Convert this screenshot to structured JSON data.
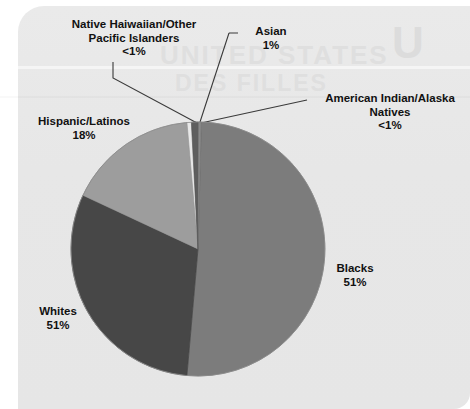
{
  "chart_data": {
    "type": "pie",
    "title": "",
    "subtitle": "",
    "xlabel": "",
    "ylabel": "",
    "legend_position": "callout-labels",
    "grid": false,
    "note": "Percentages as printed on the figure; labels point to slices with leader lines.",
    "slices": [
      {
        "name": "blacks",
        "label": "Blacks",
        "value_label": "51%",
        "value": 51,
        "color": "#7c7c7c",
        "start_angle_deg": 1.5,
        "end_angle_deg": 185.0
      },
      {
        "name": "whites",
        "label": "Whites",
        "value_label": "51%",
        "value": 31,
        "color": "#474747",
        "start_angle_deg": 185.0,
        "end_angle_deg": 295.0
      },
      {
        "name": "hispanic-latinos",
        "label": "Hispanic/Latinos",
        "value_label": "18%",
        "value": 18,
        "color": "#9d9d9d",
        "start_angle_deg": 295.0,
        "end_angle_deg": 355.0
      },
      {
        "name": "native-hawaiian-other-pacific-islanders",
        "label": "Native Haiwaiian/Other Pacific Islanders",
        "value_label": "<1%",
        "value": 0.4,
        "color": "#8a8a8a",
        "start_angle_deg": 355.0,
        "end_angle_deg": 357.0
      },
      {
        "name": "asian",
        "label": "Asian",
        "value_label": "1%",
        "value": 1,
        "color": "#5e5e5e",
        "start_angle_deg": 357.0,
        "end_angle_deg": 360.2
      },
      {
        "name": "american-indian-alaska-natives",
        "label": "American Indian/Alaska Natives",
        "value_label": "<1%",
        "value": 0.4,
        "color": "#8a8a8a",
        "start_angle_deg": 360.2,
        "end_angle_deg": 361.5
      }
    ],
    "categories": [
      "Blacks",
      "Whites",
      "Hispanic/Latinos",
      "Native Haiwaiian/Other Pacific Islanders",
      "Asian",
      "American Indian/Alaska Natives"
    ],
    "values": [
      51,
      51,
      18,
      0.4,
      1,
      0.4
    ],
    "value_labels": [
      "51%",
      "51%",
      "18%",
      "<1%",
      "1%",
      "<1%"
    ]
  },
  "labels": {
    "nhpi": {
      "line1": "Native Haiwaiian/Other",
      "line2": "Pacific Islanders",
      "value": "<1%"
    },
    "asian": {
      "line1": "Asian",
      "value": "1%"
    },
    "aian": {
      "line1": "American Indian/Alaska",
      "line2": "Natives",
      "value": "<1%"
    },
    "hispanic": {
      "line1": "Hispanic/Latinos",
      "value": "18%"
    },
    "blacks": {
      "line1": "Blacks",
      "value": "51%"
    },
    "whites": {
      "line1": "Whites",
      "value": "51%"
    }
  },
  "background": {
    "bleed_text_1": "UNITED STATES",
    "bleed_text_2": "DES FILLES",
    "bleed_text_3": "U",
    "panel_color": "#e8e8e8"
  },
  "colors": {
    "blacks": "#7c7c7c",
    "whites": "#474747",
    "hispanic": "#9d9d9d",
    "thin_slices": "#6a6a6a",
    "leader_line": "#3a3a3a",
    "text": "#111111"
  }
}
